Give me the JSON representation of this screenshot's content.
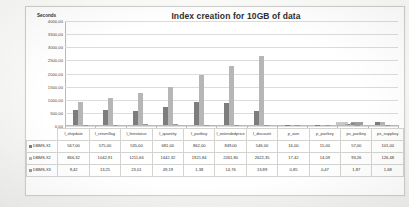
{
  "chart_data": {
    "type": "bar",
    "title": "Index creation for 10GB of data",
    "xlabel": "",
    "ylabel": "Seconds",
    "ylim": [
      0,
      4000
    ],
    "grid": true,
    "legend_position": "bottom-table",
    "yticks": [
      "4000,00",
      "3500,00",
      "3000,00",
      "2500,00",
      "2000,00",
      "1500,00",
      "1000,00",
      "500,00",
      "0,00"
    ],
    "categories": [
      "l_shipdate",
      "l_returnflag",
      "l_linestatus",
      "l_quantity",
      "l_partkey",
      "l_extendedprice",
      "l_discount",
      "p_size",
      "p_partkey",
      "ps_partkey",
      "ps_suppkey"
    ],
    "series": [
      {
        "name": "DBMS-X1",
        "color": "#7d7d7d",
        "values": [
          567.0,
          575.0,
          535.0,
          681.0,
          862.0,
          849.0,
          546.0,
          16.0,
          15.0,
          57.0,
          101.0
        ]
      },
      {
        "name": "DBMS-X2",
        "color": "#b6b6b6",
        "values": [
          866.32,
          1042.91,
          1211.66,
          1442.32,
          1921.84,
          2261.8,
          2622.35,
          17.42,
          14.09,
          93.26,
          126.48
        ]
      },
      {
        "name": "DBMS-X3",
        "color": "#9a9a9a",
        "values": [
          9.42,
          13.25,
          23.01,
          49.19,
          1.38,
          14.76,
          13.89,
          0.85,
          0.47,
          1.87,
          1.68
        ]
      }
    ]
  },
  "table": {
    "corner_label": "",
    "headers": [
      "l_shipdate",
      "l_returnflag",
      "l_linestatus",
      "l_quantity",
      "l_partkey",
      "l_extendedprice",
      "l_discount",
      "p_size",
      "p_partkey",
      "ps_partkey",
      "ps_suppkey"
    ],
    "rows": [
      {
        "label": "DBMS-X1",
        "swatch": "sw0",
        "values": [
          "567,00",
          "575,00",
          "535,00",
          "681,00",
          "862,00",
          "849,00",
          "546,00",
          "16,00",
          "15,00",
          "57,00",
          "101,00"
        ]
      },
      {
        "label": "DBMS-X2",
        "swatch": "sw1",
        "values": [
          "866,32",
          "1042,91",
          "1211,66",
          "1442,32",
          "1921,84",
          "2261,80",
          "2622,35",
          "17,42",
          "14,09",
          "93,26",
          "126,48"
        ]
      },
      {
        "label": "DBMS-X3",
        "swatch": "sw2",
        "values": [
          "9,42",
          "13,25",
          "23,01",
          "49,19",
          "1,38",
          "14,76",
          "13,89",
          "0,85",
          "0,47",
          "1,87",
          "1,68"
        ]
      }
    ]
  }
}
